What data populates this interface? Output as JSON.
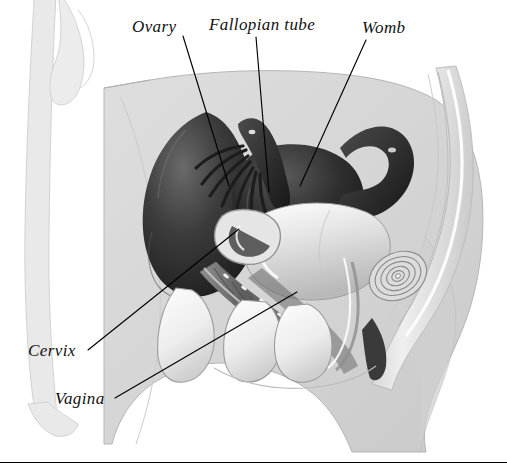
{
  "figure": {
    "orientation": "side view, facing left",
    "style": "grayscale medical illustration with ink leader lines",
    "background_color": "#ffffff",
    "body_fill_color": "#d8d8d8",
    "organ_dark_color": "#2a2a2a",
    "leader_line_color": "#000000",
    "bottom_rule_color": "#000000"
  },
  "labels": {
    "ovary": "Ovary",
    "fallopian_tube": "Fallopian tube",
    "womb": "Womb",
    "cervix": "Cervix",
    "vagina": "Vagina"
  },
  "annotations": [
    {
      "name": "ovary",
      "text": "Ovary",
      "label_x": 132,
      "label_y": 18,
      "leader_from": [
        183,
        36
      ],
      "leader_to": [
        229,
        186
      ]
    },
    {
      "name": "fallopian-tube",
      "text": "Fallopian tube",
      "label_x": 209,
      "label_y": 16,
      "leader_from": [
        256,
        37
      ],
      "leader_to": [
        269,
        192
      ]
    },
    {
      "name": "womb",
      "text": "Womb",
      "label_x": 362,
      "label_y": 19,
      "leader_from": [
        366,
        40
      ],
      "leader_to": [
        300,
        186
      ]
    },
    {
      "name": "cervix",
      "text": "Cervix",
      "label_x": 28,
      "label_y": 342,
      "leader_from": [
        88,
        350
      ],
      "leader_to": [
        239,
        229
      ]
    },
    {
      "name": "vagina",
      "text": "Vagina",
      "label_x": 55,
      "label_y": 390,
      "leader_from": [
        115,
        398
      ],
      "leader_to": [
        297,
        292
      ]
    }
  ],
  "structures": [
    {
      "name": "body-outline",
      "description": "grey torso and pelvis silhouette"
    },
    {
      "name": "arm-silhouette",
      "description": "faint arm and hand outline at left edge"
    },
    {
      "name": "uterus",
      "description": "dark pear shaped womb at centre"
    },
    {
      "name": "fallopian-tube-left",
      "description": "dark curved tube with fimbriae"
    },
    {
      "name": "fallopian-tube-right",
      "description": "looped tube to the right of the womb"
    },
    {
      "name": "ovary-mass",
      "description": "dark rounded ovary and bowel mass at left"
    },
    {
      "name": "bladder",
      "description": "pale rounded bladder in front of the womb"
    },
    {
      "name": "vaginal-canal",
      "description": "ridged canal running down and forward"
    },
    {
      "name": "cervix",
      "description": "neck of the womb above the vaginal canal"
    },
    {
      "name": "rectum",
      "description": "concentric ringed cross-section at right"
    },
    {
      "name": "sacrum-spine",
      "description": "curved spinal column at right margin"
    },
    {
      "name": "pubic-bone",
      "description": "pale bone block below the bladder"
    }
  ]
}
